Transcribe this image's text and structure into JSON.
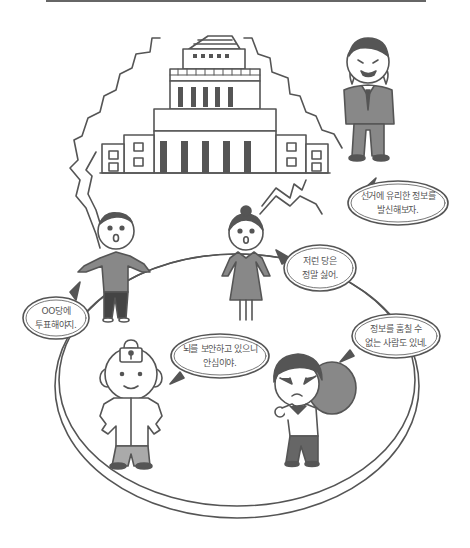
{
  "scene": {
    "subject": "election information security illustration",
    "colors": {
      "line": "#555555",
      "dark_fill": "#555555",
      "mid_fill": "#888888",
      "light_fill": "#aaaaaa",
      "background": "#ffffff"
    }
  },
  "characters": [
    {
      "id": "politician",
      "description": "smirking man in suit"
    },
    {
      "id": "boy",
      "description": "surprised boy"
    },
    {
      "id": "girl",
      "description": "surprised girl with bun"
    },
    {
      "id": "secured-man",
      "description": "smiling man with padlock on head"
    },
    {
      "id": "thief",
      "description": "masked thief with sack"
    }
  ],
  "bubbles": {
    "politician": {
      "line1": "선거에 유리한 정보를",
      "line2": "발신해보자."
    },
    "girl": {
      "line1": "저런 당은",
      "line2": "정말 싫어."
    },
    "boy": {
      "line1": "OO당에",
      "line2": "투표해야지."
    },
    "secured": {
      "line1": "뇌를 보안하고 있으니",
      "line2": "안심이야."
    },
    "thief": {
      "line1": "정보를 훔칠 수",
      "line2": "없는 사람도 있네."
    }
  }
}
